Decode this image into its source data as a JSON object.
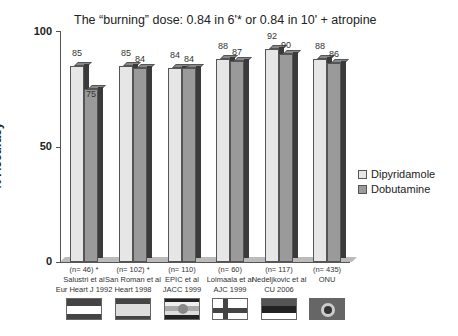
{
  "chart_data": {
    "type": "bar",
    "title": "The “burning” dose: 0.84 in 6'* or 0.84 in 10' + atropine",
    "xlabel": "",
    "ylabel": "% Accuracy",
    "ylim": [
      0,
      100
    ],
    "yticks": [
      "0",
      "50",
      "100"
    ],
    "grid": false,
    "legend_position": "right",
    "categories": [
      "(n= 46) * Salustri et al Eur Heart J 1992",
      "(n= 102) * San Roman et al Heart 1998",
      "(n= 110) EPIC et al JACC 1999",
      "(n= 60) Loimaala et al AJC 1999",
      "(n= 117) Nedeljkovic et al CU 2006",
      "(n= 435) ONU"
    ],
    "series": [
      {
        "name": "Dipyridamole",
        "color": "#e6e6e6",
        "values": [
          85,
          85,
          84,
          88,
          92,
          88
        ]
      },
      {
        "name": "Dobutamine",
        "color": "#9a9a9a",
        "values": [
          75,
          84,
          84,
          87,
          90,
          86
        ]
      }
    ]
  },
  "title": "The “burning” dose: 0.84 in 6'* or 0.84 in 10' + atropine",
  "yaxis": {
    "label": "% Accuracy",
    "t0": "0",
    "t50": "50",
    "t100": "100"
  },
  "legend": {
    "dip": "Dipyridamole",
    "dob": "Dobutamine"
  },
  "studies": [
    {
      "n": "(n= 46) *",
      "name": "Salustri et al",
      "ref": "Eur Heart J 1992",
      "dip": "85",
      "dob": "75",
      "flag": "austria-flag"
    },
    {
      "n": "(n= 102) *",
      "name": "San Roman et al",
      "ref": "Heart 1998",
      "dip": "85",
      "dob": "84",
      "flag": "spain-flag"
    },
    {
      "n": "(n= 110)",
      "name": "EPIC et al",
      "ref": "JACC 1999",
      "dip": "84",
      "dob": "84",
      "flag": "multinational-flag"
    },
    {
      "n": "(n= 60)",
      "name": "Loimaala et al",
      "ref": "AJC 1999",
      "dip": "88",
      "dob": "87",
      "flag": "finland-flag"
    },
    {
      "n": "(n= 117)",
      "name": "Nedeljkovic et al",
      "ref": "CU 2006",
      "dip": "92",
      "dob": "90",
      "flag": "serbia-flag"
    },
    {
      "n": "(n= 435)",
      "name": "ONU",
      "ref": "",
      "dip": "88",
      "dob": "86",
      "flag": "un-flag"
    }
  ]
}
